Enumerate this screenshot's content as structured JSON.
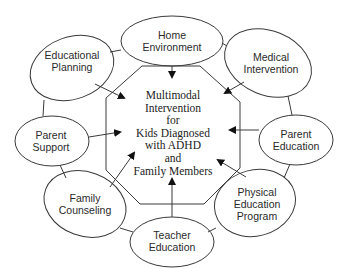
{
  "diagram": {
    "type": "hub-and-spoke",
    "center": {
      "label": "Multimodal\nIntervention\nfor\nKids Diagnosed\nwith ADHD\nand\nFamily Members",
      "shape": "octagon"
    },
    "nodes": [
      {
        "id": "home",
        "label": "Home\nEnvironment"
      },
      {
        "id": "medical",
        "label": "Medical\nIntervention"
      },
      {
        "id": "parent_education",
        "label": "Parent\nEducation"
      },
      {
        "id": "physical_education",
        "label": "Physical\nEducation\nProgram"
      },
      {
        "id": "teacher_education",
        "label": "Teacher\nEducation"
      },
      {
        "id": "family_counseling",
        "label": "Family\nCounseling"
      },
      {
        "id": "parent_support",
        "label": "Parent\nSupport"
      },
      {
        "id": "educational_planning",
        "label": "Educational\nPlanning"
      }
    ],
    "edges_to_center": [
      "home",
      "medical",
      "parent_education",
      "physical_education",
      "teacher_education",
      "family_counseling",
      "parent_support",
      "educational_planning"
    ],
    "ring_connections": [
      [
        "home",
        "medical"
      ],
      [
        "medical",
        "parent_education"
      ],
      [
        "parent_education",
        "physical_education"
      ],
      [
        "physical_education",
        "teacher_education"
      ],
      [
        "teacher_education",
        "family_counseling"
      ],
      [
        "family_counseling",
        "parent_support"
      ],
      [
        "parent_support",
        "educational_planning"
      ],
      [
        "educational_planning",
        "home"
      ]
    ],
    "colors": {
      "stroke": "#3a3a3a",
      "background": "#ffffff",
      "text": "#2a2a2a"
    }
  }
}
